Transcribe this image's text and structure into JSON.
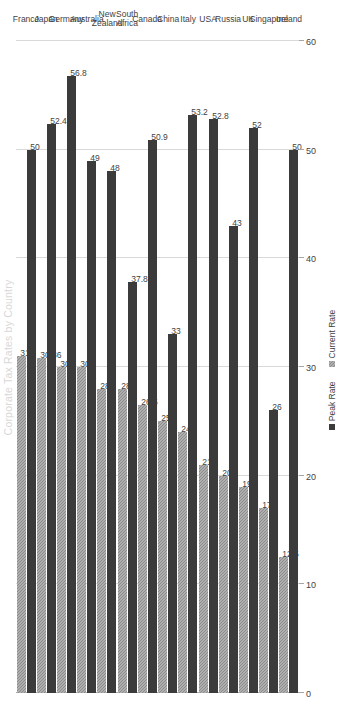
{
  "chart_data": {
    "type": "bar",
    "orientation": "horizontal",
    "title": "Corporate Tax Rates by Country",
    "xlabel": "",
    "ylabel": "",
    "xlim": [
      0,
      60
    ],
    "xticks": [
      0,
      10,
      20,
      30,
      40,
      50,
      60
    ],
    "grid": true,
    "legend_position": "bottom",
    "categories": [
      "France",
      "Japan",
      "Germany",
      "Australia",
      "New Zealand",
      "South Africa",
      "Canada",
      "China",
      "Italy",
      "USA",
      "Russia",
      "UK",
      "Singapore",
      "Ireland"
    ],
    "series": [
      {
        "name": "Peak Rate",
        "color": "#3b3b3b",
        "values": [
          50,
          52.4,
          56.8,
          49,
          48,
          37.8,
          50.9,
          33,
          53.2,
          52.8,
          43,
          52,
          26,
          50
        ],
        "labels": [
          "50",
          "52.4",
          "56.8",
          "49",
          "48",
          "37.8",
          "50.9",
          "33",
          "53.2",
          "52.8",
          "43",
          "52",
          "26",
          "50"
        ]
      },
      {
        "name": "Current Rate",
        "color": "#8c8c8c",
        "values": [
          31,
          30.86,
          30,
          30,
          28,
          28,
          26.5,
          25,
          24,
          21,
          20,
          19,
          17,
          12.5
        ],
        "labels": [
          "31",
          "30.86",
          "30",
          "30",
          "28",
          "28",
          "26.5",
          "25",
          "24",
          "21",
          "20",
          "19",
          "17",
          "12.5"
        ]
      }
    ]
  }
}
